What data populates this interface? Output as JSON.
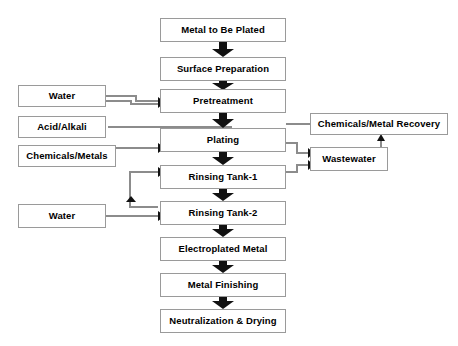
{
  "diagram": {
    "background_color": "#ffffff",
    "box_border_color": "#9a9a9a",
    "connector_color": "#808080",
    "arrow_color": "#000000",
    "nodes": [
      {
        "id": "metal_to_be_plated",
        "label": "Metal to Be Plated",
        "x": 160,
        "y": 18,
        "w": 126,
        "h": 24,
        "column": "main"
      },
      {
        "id": "surface_preparation",
        "label": "Surface Preparation",
        "x": 160,
        "y": 57,
        "w": 126,
        "h": 24,
        "column": "main"
      },
      {
        "id": "pretreatment",
        "label": "Pretreatment",
        "x": 160,
        "y": 89,
        "w": 126,
        "h": 24,
        "column": "main"
      },
      {
        "id": "plating",
        "label": "Plating",
        "x": 160,
        "y": 128,
        "w": 126,
        "h": 24,
        "column": "main"
      },
      {
        "id": "rinsing_tank_1",
        "label": "Rinsing Tank-1",
        "x": 160,
        "y": 165,
        "w": 126,
        "h": 24,
        "column": "main"
      },
      {
        "id": "rinsing_tank_2",
        "label": "Rinsing Tank-2",
        "x": 160,
        "y": 201,
        "w": 126,
        "h": 24,
        "column": "main"
      },
      {
        "id": "electroplated_metal",
        "label": "Electroplated Metal",
        "x": 160,
        "y": 237,
        "w": 126,
        "h": 24,
        "column": "main"
      },
      {
        "id": "metal_finishing",
        "label": "Metal Finishing",
        "x": 160,
        "y": 273,
        "w": 126,
        "h": 24,
        "column": "main"
      },
      {
        "id": "neutralization_drying",
        "label": "Neutralization & Drying",
        "x": 160,
        "y": 309,
        "w": 126,
        "h": 24,
        "column": "main"
      },
      {
        "id": "water_top",
        "label": "Water",
        "x": 18,
        "y": 85,
        "w": 88,
        "h": 22,
        "column": "input"
      },
      {
        "id": "acid_alkali",
        "label": "Acid/Alkali",
        "x": 18,
        "y": 116,
        "w": 88,
        "h": 22,
        "column": "input"
      },
      {
        "id": "chemicals_metals",
        "label": "Chemicals/Metals",
        "x": 18,
        "y": 145,
        "w": 98,
        "h": 22,
        "column": "input"
      },
      {
        "id": "water_bottom",
        "label": "Water",
        "x": 18,
        "y": 204,
        "w": 88,
        "h": 24,
        "column": "input"
      },
      {
        "id": "chemicals_metal_recovery",
        "label": "Chemicals/Metal Recovery",
        "x": 310,
        "y": 113,
        "w": 138,
        "h": 22,
        "column": "output"
      },
      {
        "id": "wastewater",
        "label": "Wastewater",
        "x": 310,
        "y": 147,
        "w": 78,
        "h": 24,
        "column": "output"
      }
    ],
    "flows": [
      {
        "from": "metal_to_be_plated",
        "to": "surface_preparation",
        "kind": "thick-down"
      },
      {
        "from": "surface_preparation",
        "to": "pretreatment",
        "kind": "thick-down"
      },
      {
        "from": "pretreatment",
        "to": "plating",
        "kind": "thick-down"
      },
      {
        "from": "plating",
        "to": "rinsing_tank_1",
        "kind": "thick-down"
      },
      {
        "from": "rinsing_tank_1",
        "to": "rinsing_tank_2",
        "kind": "thick-down"
      },
      {
        "from": "rinsing_tank_2",
        "to": "electroplated_metal",
        "kind": "thick-down"
      },
      {
        "from": "electroplated_metal",
        "to": "metal_finishing",
        "kind": "thick-down"
      },
      {
        "from": "metal_finishing",
        "to": "neutralization_drying",
        "kind": "thick-down"
      },
      {
        "from": "water_top",
        "to": "pretreatment",
        "kind": "thin-elbow"
      },
      {
        "from": "chemicals_metals",
        "to": "plating",
        "kind": "thin-elbow"
      },
      {
        "from": "plating",
        "to": "acid_alkali",
        "kind": "thin-left"
      },
      {
        "from": "plating",
        "to": "chemicals_metal_recovery",
        "kind": "thin-right"
      },
      {
        "from": "plating",
        "to": "wastewater",
        "kind": "thin-elbow"
      },
      {
        "from": "rinsing_tank_1",
        "to": "wastewater",
        "kind": "thin-elbow"
      },
      {
        "from": "rinsing_tank_2",
        "to": "rinsing_tank_1",
        "kind": "thin-loop"
      },
      {
        "from": "water_bottom",
        "to": "rinsing_tank_2",
        "kind": "thin-right"
      },
      {
        "from": "wastewater",
        "to": "chemicals_metal_recovery",
        "kind": "thin-up"
      }
    ]
  }
}
